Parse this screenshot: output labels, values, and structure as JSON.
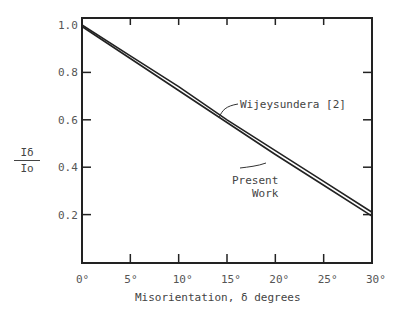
{
  "chart_data": {
    "type": "line",
    "title": "",
    "xlabel": "Misorientation, δ degrees",
    "ylabel": "Iδ / Io",
    "ylabel_numerator": "Iδ",
    "ylabel_denominator": "Io",
    "x_ticks": [
      "0°",
      "5°",
      "10°",
      "15°",
      "20°",
      "25°",
      "30°"
    ],
    "y_ticks": [
      "1.0",
      "0.8",
      "0.6",
      "0.4",
      "0.2"
    ],
    "xlim": [
      0,
      30
    ],
    "ylim": [
      0.0,
      1.02
    ],
    "grid": false,
    "legend": "annotations on lines",
    "x": [
      0,
      5,
      10,
      15,
      20,
      25,
      30
    ],
    "series": [
      {
        "name": "Wijeysundera [2]",
        "values": [
          1.0,
          0.87,
          0.74,
          0.6,
          0.47,
          0.34,
          0.21
        ]
      },
      {
        "name": "Present Work",
        "values": [
          1.0,
          0.865,
          0.73,
          0.595,
          0.46,
          0.33,
          0.2
        ]
      }
    ],
    "annotations": [
      {
        "text": "Wijeysundera [2]",
        "points_to": "upper line near 15°"
      },
      {
        "text": "Present Work",
        "points_to": "lower line near 18°"
      }
    ]
  }
}
